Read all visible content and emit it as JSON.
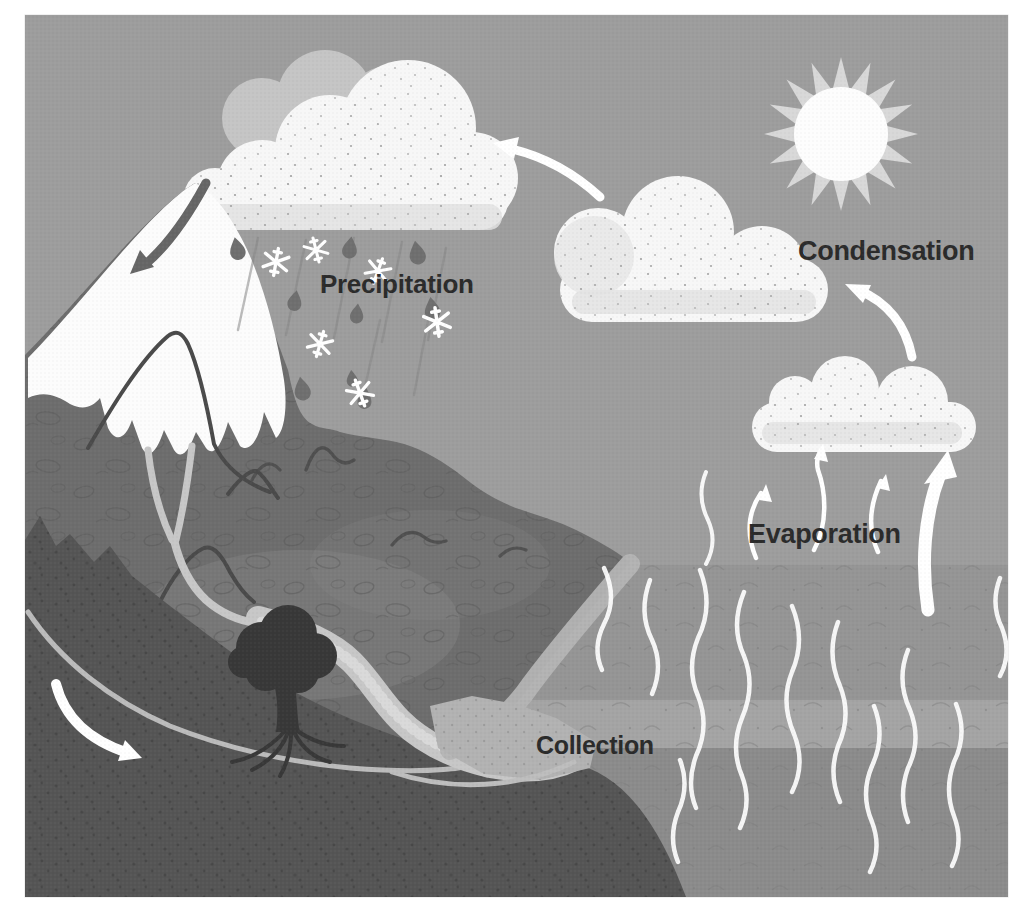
{
  "figure": {
    "type": "water-cycle-diagram",
    "labels": {
      "precipitation": "Precipitation",
      "condensation": "Condensation",
      "evaporation": "Evaporation",
      "collection": "Collection"
    },
    "colors": {
      "page_background": "#ffffff",
      "sky": "#9d9d9d",
      "sea": "#959595",
      "sea_band_light": "#a4a4a4",
      "sea_deep": "#8b8b8b",
      "cloud": "#f7f7f7",
      "cloud_back": "#c5c5c5",
      "cloud_shadow": "#e2e2e2",
      "sun_core": "#fdfdfd",
      "sun_rays": "#d8d8d8",
      "mountain": "#6d6d6d",
      "snow": "#fcfcfc",
      "foreground_hill": "#555555",
      "river": "#c7c7c7",
      "beach": "#b4b4b4",
      "tree": "#383838",
      "rain_drop": "#6f6f6f",
      "ridge_line": "#4a4a4a",
      "label_text": "#2b2b2b",
      "arrow_light": "#ffffff",
      "arrow_dark": "#666666"
    }
  }
}
